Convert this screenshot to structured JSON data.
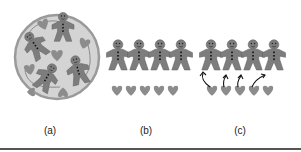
{
  "figure": {
    "panels": [
      {
        "id": "a",
        "label": "(a)",
        "description": "Plate with gingerbread men and hearts mixed together",
        "gingerbread_count": 4,
        "heart_count": 6
      },
      {
        "id": "b",
        "label": "(b)",
        "description": "Row of gingerbread men with row of hearts below",
        "gingerbread_count": 4,
        "heart_count": 5
      },
      {
        "id": "c",
        "label": "(c)",
        "description": "Row of gingerbread men with hearts below, arrows pairing hearts to men",
        "gingerbread_count": 4,
        "heart_count": 5,
        "arrow_count": 4
      }
    ],
    "colors": {
      "plate_fill": "#d4d4d4",
      "plate_rim": "#9a9a9a",
      "cookie": "#7d7d7d",
      "cookie_dark": "#5e5e5e",
      "heart": "#8c8c8c",
      "arrow": "#111111",
      "rule": "#555555"
    }
  }
}
